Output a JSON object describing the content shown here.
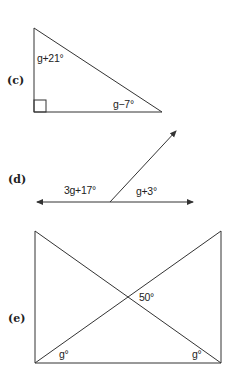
{
  "diagram": {
    "colors": {
      "line": "#333333",
      "text": "#222222",
      "background": "#ffffff"
    },
    "parts": [
      {
        "id": "c",
        "label": "(c)",
        "shape": "right-triangle",
        "angles": {
          "top": "g+21°",
          "bottom_right": "g−7°",
          "bottom_left": "right-angle"
        }
      },
      {
        "id": "d",
        "label": "(d)",
        "shape": "line-with-ray",
        "angles": {
          "left": "3g+17°",
          "right": "g+3°"
        }
      },
      {
        "id": "e",
        "label": "(e)",
        "shape": "rectangle-with-diagonals",
        "angles": {
          "intersection": "50°",
          "bottom_left": "g°",
          "bottom_right": "g°"
        }
      }
    ]
  }
}
